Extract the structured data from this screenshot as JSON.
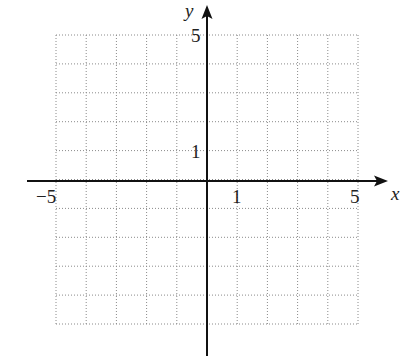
{
  "graph": {
    "x_axis_label": "x",
    "y_axis_label": "y",
    "tick_labels": {
      "x_neg": "−5",
      "x_one": "1",
      "x_pos": "5",
      "y_one": "1",
      "y_pos": "5"
    },
    "x_range": [
      -5,
      5
    ],
    "y_range": [
      -5,
      5
    ],
    "grid_step": 1,
    "grid_style": "dotted",
    "axis_color": "#111111",
    "grid_color": "#8a8a8a"
  }
}
